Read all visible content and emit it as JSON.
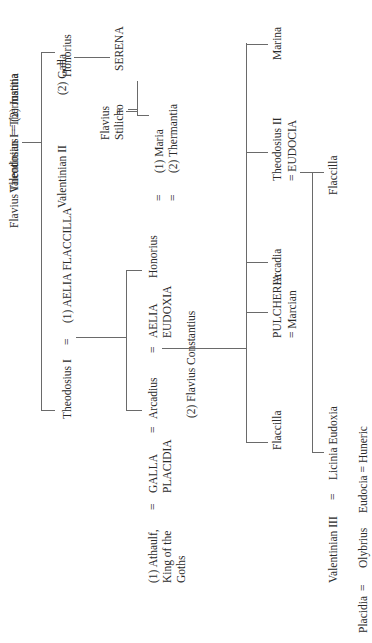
{
  "diagram": {
    "type": "family-tree",
    "orientation": "rotated-90-ccw",
    "line_color": "#6a6a6a",
    "text_color": "#2a2a2a"
  },
  "people": {
    "flavius_theodosius_thermantia": "Flavius Theodosius = Thermantia",
    "honorius_elder": "Honorius",
    "serena": "SERENA",
    "stilicho_eq": "=",
    "flavius_stilicho_1": "Flavius",
    "flavius_stilicho_2": "Stilicho",
    "maria": "(1) Maria",
    "thermantia": "(2) Thermantia",
    "eq_maria": "=",
    "eq_thermantia": "=",
    "theodosius_i": "Theodosius I",
    "eq_theo_aelia": "=",
    "aelia_flaccilla": "(1) AELIA FLACCILLA",
    "eq_galla_theo": "=",
    "valentinian_i_justina": "Valentinian I = (2) Justina",
    "valentinian_ii": "Valentinian II",
    "galla": "(2) Galla",
    "arcadius": "Arcadius",
    "eq_arcadius": "=",
    "aelia_eudoxia_1": "AELIA",
    "aelia_eudoxia_2": "EUDOXIA",
    "honorius_emperor": "Honorius",
    "galla_placidia_1": "GALLA",
    "galla_placidia_2": "PLACIDIA",
    "eq_gp_left": "=",
    "eq_gp_right": "=",
    "flavius_constantius": "(2) Flavius Constantius",
    "athaulf_1": "(1) Athaulf,",
    "athaulf_2": "King of the",
    "athaulf_3": "Goths",
    "flaccilla_daughter": "Flaccilla",
    "pulcheria": "PULCHERIA",
    "marcian": "= Marcian",
    "arcadia": "Arcadia",
    "theodosius_ii": "Theodosius II",
    "eudocia_empress": "= EUDOCIA",
    "marina": "Marina",
    "flaccilla_granddaughter": "Flaccilla",
    "valentinian_iii": "Valentinian III",
    "eq_val3": "=",
    "licinia_eudoxia": "Licinia Eudoxia",
    "placidia": "Placidia",
    "eq_placidia": "=",
    "olybrius": "Olybrius",
    "eudocia_huneric": "Eudocia = Huneric"
  }
}
